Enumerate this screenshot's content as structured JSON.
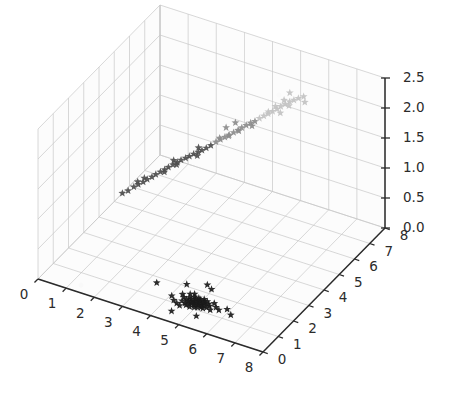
{
  "figure": {
    "kind": "matplotlib-3d-scatter",
    "background_color": "#ffffff",
    "pane_color": "#fcfcfc",
    "grid_color": "#c8c8c8",
    "axis_line_color": "#2b2b2b",
    "tick_label_color": "#2b2b2b"
  },
  "axes": {
    "x": {
      "label": "",
      "ticks": [
        "0",
        "1",
        "2",
        "3",
        "4",
        "5",
        "6",
        "7",
        "8"
      ],
      "range": [
        0,
        8
      ],
      "position": "front-left-bottom-edge"
    },
    "y": {
      "label": "",
      "ticks": [
        "0",
        "1",
        "2",
        "3",
        "4",
        "5",
        "6",
        "7",
        "8"
      ],
      "range": [
        0,
        8
      ],
      "position": "front-right-bottom-edge"
    },
    "z": {
      "label": "",
      "ticks": [
        "0.0",
        "0.5",
        "1.0",
        "1.5",
        "2.0",
        "2.5"
      ],
      "range": [
        0.0,
        2.5
      ],
      "position": "right-vertical-edge"
    }
  },
  "chart_data": {
    "type": "scatter",
    "title": "",
    "xlabel": "",
    "ylabel": "",
    "zlabel": "",
    "xlim": [
      0,
      8
    ],
    "ylim": [
      0,
      8
    ],
    "zlim": [
      0.0,
      2.5
    ],
    "grid": true,
    "legend": null,
    "marker": "star",
    "series": [
      {
        "name": "floor-cluster",
        "color": "#1a1a1a",
        "marker": "star",
        "description": "dense black star-marker cluster lying on the z=0 floor plane",
        "points": [
          [
            4.05,
            1.3,
            0.0
          ],
          [
            4.22,
            1.12,
            0.0
          ],
          [
            4.3,
            1.55,
            0.0
          ],
          [
            4.38,
            1.02,
            0.0
          ],
          [
            4.42,
            1.42,
            0.0
          ],
          [
            4.46,
            1.22,
            0.0
          ],
          [
            4.5,
            1.68,
            0.0
          ],
          [
            4.52,
            0.95,
            0.0
          ],
          [
            4.55,
            1.35,
            0.0
          ],
          [
            4.58,
            1.5,
            0.0
          ],
          [
            4.6,
            1.15,
            0.0
          ],
          [
            4.62,
            1.75,
            0.0
          ],
          [
            4.64,
            1.28,
            0.0
          ],
          [
            4.66,
            1.44,
            0.0
          ],
          [
            4.68,
            1.08,
            0.0
          ],
          [
            4.7,
            1.6,
            0.0
          ],
          [
            4.72,
            1.33,
            0.0
          ],
          [
            4.74,
            1.18,
            0.0
          ],
          [
            4.76,
            1.52,
            0.0
          ],
          [
            4.78,
            1.25,
            0.0
          ],
          [
            4.8,
            1.4,
            0.0
          ],
          [
            4.82,
            1.05,
            0.0
          ],
          [
            4.84,
            1.62,
            0.0
          ],
          [
            4.86,
            1.3,
            0.0
          ],
          [
            4.88,
            1.46,
            0.0
          ],
          [
            4.9,
            1.2,
            0.0
          ],
          [
            4.92,
            1.56,
            0.0
          ],
          [
            4.94,
            1.36,
            0.0
          ],
          [
            4.96,
            1.1,
            0.0
          ],
          [
            4.98,
            1.48,
            0.0
          ],
          [
            5.0,
            1.26,
            0.0
          ],
          [
            5.02,
            1.64,
            0.0
          ],
          [
            5.04,
            1.38,
            0.0
          ],
          [
            5.06,
            1.14,
            0.0
          ],
          [
            5.08,
            1.54,
            0.0
          ],
          [
            5.1,
            1.32,
            0.0
          ],
          [
            5.12,
            1.44,
            0.0
          ],
          [
            5.14,
            1.22,
            0.0
          ],
          [
            5.16,
            1.58,
            0.0
          ],
          [
            5.18,
            1.34,
            0.0
          ],
          [
            5.22,
            1.18,
            0.0
          ],
          [
            5.26,
            1.48,
            0.0
          ],
          [
            5.3,
            1.28,
            0.0
          ],
          [
            5.34,
            1.4,
            0.0
          ],
          [
            5.4,
            1.6,
            0.0
          ],
          [
            5.46,
            1.22,
            0.0
          ],
          [
            5.55,
            1.44,
            0.0
          ],
          [
            5.7,
            1.35,
            0.0
          ],
          [
            5.9,
            1.52,
            0.0
          ],
          [
            6.15,
            1.3,
            0.0
          ],
          [
            3.3,
            1.7,
            0.0
          ],
          [
            4.15,
            2.1,
            0.0
          ],
          [
            4.95,
            2.25,
            0.0
          ],
          [
            5.25,
            0.7,
            0.0
          ],
          [
            4.45,
            0.55,
            0.0
          ],
          [
            4.72,
            2.4,
            0.0
          ]
        ]
      },
      {
        "name": "diagonal-streak-dark",
        "color": "#4d4d4d",
        "marker": "star",
        "description": "lower, darker portion of the rising diagonal point streak",
        "points": [
          [
            1.55,
            3.05,
            0.92
          ],
          [
            1.7,
            3.15,
            0.98
          ],
          [
            1.82,
            3.22,
            1.02
          ],
          [
            1.95,
            3.3,
            1.06
          ],
          [
            2.05,
            3.38,
            1.1
          ],
          [
            2.18,
            3.45,
            1.14
          ],
          [
            2.28,
            3.52,
            1.18
          ],
          [
            2.4,
            3.6,
            1.22
          ],
          [
            2.52,
            3.66,
            1.26
          ],
          [
            2.62,
            3.72,
            1.3
          ],
          [
            2.74,
            3.8,
            1.34
          ],
          [
            2.86,
            3.86,
            1.38
          ],
          [
            2.96,
            3.92,
            1.42
          ],
          [
            3.08,
            4.0,
            1.45
          ],
          [
            3.18,
            4.06,
            1.48
          ],
          [
            3.3,
            4.12,
            1.52
          ],
          [
            3.42,
            4.2,
            1.55
          ],
          [
            3.52,
            4.26,
            1.58
          ],
          [
            3.64,
            4.32,
            1.62
          ],
          [
            3.76,
            4.4,
            1.66
          ],
          [
            2.1,
            3.1,
            1.2
          ],
          [
            2.35,
            3.95,
            1.12
          ],
          [
            2.9,
            3.55,
            1.5
          ],
          [
            3.25,
            4.45,
            1.4
          ],
          [
            1.4,
            2.95,
            0.88
          ],
          [
            1.62,
            3.55,
            0.95
          ],
          [
            2.68,
            4.15,
            1.24
          ],
          [
            3.55,
            3.98,
            1.7
          ]
        ]
      },
      {
        "name": "diagonal-streak-mid",
        "color": "#8c8c8c",
        "marker": "star",
        "description": "middle portion of the rising diagonal point streak, medium gray",
        "points": [
          [
            3.9,
            4.48,
            1.72
          ],
          [
            4.02,
            4.55,
            1.76
          ],
          [
            4.14,
            4.62,
            1.8
          ],
          [
            4.26,
            4.68,
            1.84
          ],
          [
            4.38,
            4.75,
            1.88
          ],
          [
            4.5,
            4.82,
            1.92
          ],
          [
            4.6,
            4.88,
            1.96
          ],
          [
            4.72,
            4.95,
            2.0
          ],
          [
            4.84,
            5.02,
            2.04
          ],
          [
            4.96,
            5.08,
            2.07
          ],
          [
            3.95,
            5.05,
            1.82
          ],
          [
            4.45,
            4.3,
            1.95
          ],
          [
            4.2,
            5.2,
            1.9
          ],
          [
            4.7,
            4.5,
            2.02
          ],
          [
            3.8,
            4.9,
            1.66
          ],
          [
            5.05,
            4.72,
            2.1
          ]
        ]
      },
      {
        "name": "diagonal-streak-light",
        "color": "#c2c2c2",
        "marker": "star",
        "description": "upper, lightest portion of the rising diagonal point streak",
        "points": [
          [
            5.08,
            5.15,
            2.12
          ],
          [
            5.2,
            5.22,
            2.16
          ],
          [
            5.32,
            5.28,
            2.2
          ],
          [
            5.44,
            5.35,
            2.24
          ],
          [
            5.56,
            5.42,
            2.28
          ],
          [
            5.66,
            5.48,
            2.32
          ],
          [
            5.78,
            5.55,
            2.36
          ],
          [
            5.9,
            5.62,
            2.4
          ],
          [
            6.02,
            5.68,
            2.43
          ],
          [
            6.14,
            5.75,
            2.46
          ],
          [
            5.35,
            5.7,
            2.22
          ],
          [
            5.85,
            5.1,
            2.34
          ],
          [
            5.55,
            5.9,
            2.3
          ],
          [
            6.05,
            5.3,
            2.44
          ],
          [
            5.18,
            5.55,
            2.14
          ],
          [
            6.3,
            5.8,
            2.5
          ],
          [
            6.45,
            5.6,
            2.48
          ],
          [
            5.7,
            6.0,
            2.42
          ]
        ]
      }
    ]
  }
}
